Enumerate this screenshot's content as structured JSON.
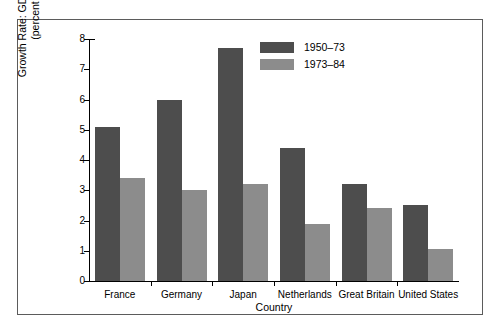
{
  "chart_data": {
    "type": "bar",
    "title": "",
    "xlabel": "Country",
    "ylabel_line1": "Growth Rate: GDP per Work Hour",
    "ylabel_line2": "(percent per year)",
    "categories": [
      "France",
      "Germany",
      "Japan",
      "Netherlands",
      "Great Britain",
      "United States"
    ],
    "series": [
      {
        "name": "1950–73",
        "color": "#4d4d4d",
        "values": [
          5.1,
          6.0,
          7.7,
          4.4,
          3.2,
          2.5
        ]
      },
      {
        "name": "1973–84",
        "color": "#8c8c8c",
        "values": [
          3.4,
          3.0,
          3.2,
          1.9,
          2.4,
          1.05
        ]
      }
    ],
    "ylim": [
      0,
      8
    ],
    "yticks": [
      0,
      1,
      2,
      3,
      4,
      5,
      6,
      7,
      8
    ],
    "ytick_labels": [
      "0",
      "1",
      "2",
      "3",
      "4",
      "5",
      "6",
      "7",
      "8"
    ],
    "grid": false,
    "legend_position": "top-right"
  },
  "legend": {
    "entries": [
      {
        "label": "1950–73"
      },
      {
        "label": "1973–84"
      }
    ]
  }
}
